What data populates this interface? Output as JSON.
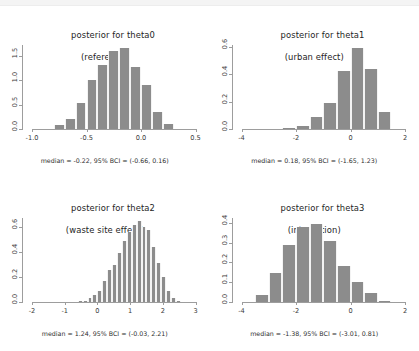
{
  "window": {
    "top_chrome_visible": true
  },
  "figure": {
    "layout": "2x2-grid",
    "bar_color": "#8c8c8c",
    "axis_color": "#9d9d9d",
    "background": "#ffffff"
  },
  "chart_data": [
    {
      "type": "bar",
      "id": "theta0",
      "title": "posterior for theta0",
      "subtitle": "(reference)",
      "caption": "median = -0.22, 95% BCI = (-0.66, 0.16)",
      "xlabel": "",
      "ylabel": "",
      "xlim": [
        -1.0,
        0.5
      ],
      "ylim": [
        0.0,
        1.75
      ],
      "xticks": [
        -1.0,
        -0.5,
        0.0,
        0.5
      ],
      "xticklabels": [
        "-1.0",
        "-0.5",
        "0.0",
        "0.5"
      ],
      "yticks": [
        0.0,
        0.5,
        1.0,
        1.5
      ],
      "yticklabels": [
        "0.0",
        "0.5",
        "1.0",
        "1.5"
      ],
      "bin_edges": [
        -0.9,
        -0.8,
        -0.7,
        -0.6,
        -0.5,
        -0.4,
        -0.3,
        -0.2,
        -0.1,
        0.0,
        0.1,
        0.2,
        0.3
      ],
      "values": [
        0.02,
        0.1,
        0.22,
        0.55,
        1.03,
        1.33,
        1.62,
        1.68,
        1.3,
        0.93,
        0.38,
        0.12
      ],
      "median": -0.22,
      "bci": [
        -0.66,
        0.16
      ],
      "grid": false,
      "legend": "none"
    },
    {
      "type": "bar",
      "id": "theta1",
      "title": "posterior for theta1",
      "subtitle": "(urban effect)",
      "caption": "median = 0.18, 95% BCI = (-1.65, 1.23)",
      "xlabel": "",
      "ylabel": "",
      "xlim": [
        -4,
        2
      ],
      "ylim": [
        0.0,
        0.62
      ],
      "xticks": [
        -4,
        -2,
        0,
        2
      ],
      "xticklabels": [
        "-4",
        "-2",
        "0",
        "2"
      ],
      "yticks": [
        0.0,
        0.2,
        0.4,
        0.6
      ],
      "yticklabels": [
        "0.0",
        "0.2",
        "0.4",
        "0.6"
      ],
      "bin_edges": [
        -2.5,
        -2.0,
        -1.5,
        -1.0,
        -0.5,
        0.0,
        0.5,
        1.0,
        1.5,
        2.0
      ],
      "values": [
        0.012,
        0.028,
        0.095,
        0.195,
        0.43,
        0.6,
        0.445,
        0.135,
        0.008
      ],
      "median": 0.18,
      "bci": [
        -1.65,
        1.23
      ],
      "grid": false,
      "legend": "none"
    },
    {
      "type": "bar",
      "id": "theta2",
      "title": "posterior for theta2",
      "subtitle": "(waste site effect)",
      "caption": "median = 1.24, 95% BCI = (-0.03, 2.21)",
      "xlabel": "",
      "ylabel": "",
      "xlim": [
        -2,
        3
      ],
      "ylim": [
        0.0,
        0.68
      ],
      "xticks": [
        -2,
        -1,
        0,
        1,
        2,
        3
      ],
      "xticklabels": [
        "-2",
        "-1",
        "0",
        "1",
        "2",
        "3"
      ],
      "yticks": [
        0.0,
        0.2,
        0.4,
        0.6
      ],
      "yticklabels": [
        "0.0",
        "0.2",
        "0.4",
        "0.6"
      ],
      "bin_edges": [
        -0.75,
        -0.6,
        -0.45,
        -0.3,
        -0.15,
        0.0,
        0.15,
        0.3,
        0.45,
        0.6,
        0.75,
        0.9,
        1.05,
        1.2,
        1.35,
        1.5,
        1.65,
        1.8,
        1.95,
        2.1,
        2.25,
        2.4,
        2.55
      ],
      "values": [
        0.01,
        0.015,
        0.02,
        0.04,
        0.065,
        0.1,
        0.175,
        0.265,
        0.305,
        0.4,
        0.495,
        0.57,
        0.625,
        0.66,
        0.605,
        0.585,
        0.45,
        0.32,
        0.205,
        0.095,
        0.04,
        0.015
      ],
      "median": 1.24,
      "bci": [
        -0.03,
        2.21
      ],
      "grid": false,
      "legend": "none"
    },
    {
      "type": "bar",
      "id": "theta3",
      "title": "posterior for theta3",
      "subtitle": "(interaction)",
      "caption": "median = -1.38, 95% BCI = (-3.01, 0.81)",
      "xlabel": "",
      "ylabel": "",
      "xlim": [
        -4,
        2
      ],
      "ylim": [
        0.0,
        0.43
      ],
      "xticks": [
        -4,
        -2,
        0,
        2
      ],
      "xticklabels": [
        "-4",
        "-2",
        "0",
        "2"
      ],
      "yticks": [
        0.0,
        0.1,
        0.2,
        0.3,
        0.4
      ],
      "yticklabels": [
        "0.0",
        "0.1",
        "0.2",
        "0.3",
        "0.4"
      ],
      "bin_edges": [
        -3.5,
        -3.0,
        -2.5,
        -2.0,
        -1.5,
        -1.0,
        -0.5,
        0.0,
        0.5,
        1.0,
        1.5
      ],
      "values": [
        0.042,
        0.15,
        0.295,
        0.385,
        0.4,
        0.315,
        0.185,
        0.105,
        0.05,
        0.012,
        0.004
      ],
      "median": -1.38,
      "bci": [
        -3.01,
        0.81
      ],
      "grid": false,
      "legend": "none"
    }
  ]
}
